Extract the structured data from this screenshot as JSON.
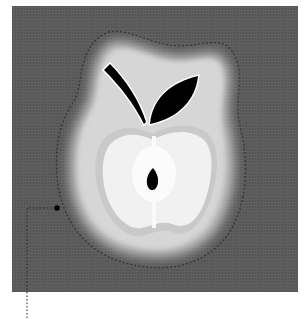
{
  "image": {
    "subject": "stylized apple with leaf, stem and seed",
    "style": "grayscale photograph of felt/fabric appliqué",
    "colors": {
      "background": "#5b5b5b",
      "halo": "#c9c9c9",
      "body_outer": "#d9d9d9",
      "body_inner": "#f2f2f2",
      "leaf": "#000000",
      "stitch": "#3a3a3a"
    }
  },
  "callout": {
    "marker": "dot",
    "line_style": "dotted"
  }
}
